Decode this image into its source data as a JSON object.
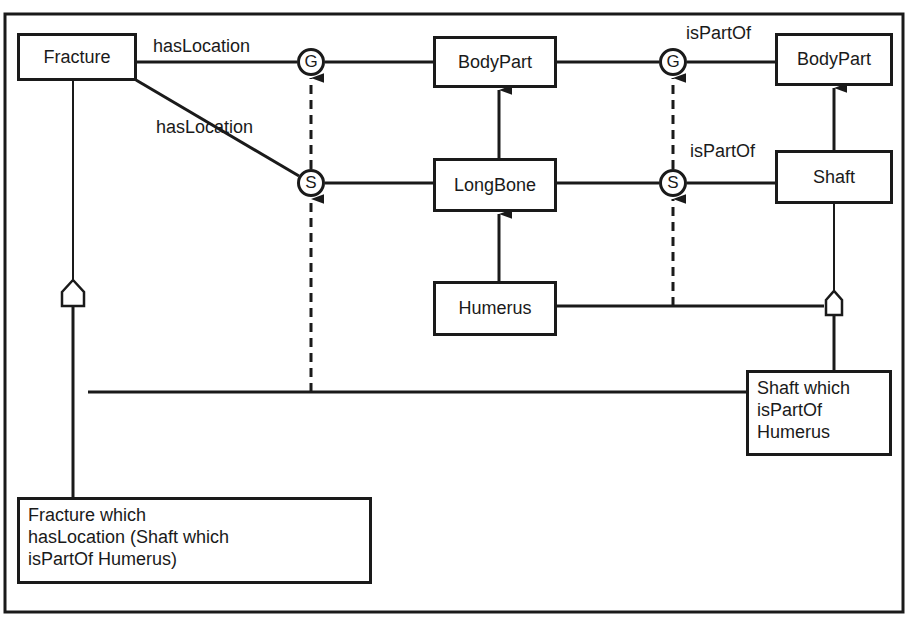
{
  "diagram": {
    "nodes": {
      "fracture": "Fracture",
      "bodypart_mid": "BodyPart",
      "bodypart_right": "BodyPart",
      "longbone": "LongBone",
      "shaft": "Shaft",
      "humerus": "Humerus",
      "shaft_which": [
        "Shaft which",
        "isPartOf",
        "Humerus"
      ],
      "fracture_which": [
        "Fracture which",
        "hasLocation (Shaft which",
        "isPartOf Humerus)"
      ]
    },
    "edge_labels": {
      "top_left": "hasLocation",
      "diag_left": "hasLocation",
      "top_right": "isPartOf",
      "mid_right": "isPartOf"
    },
    "circles": {
      "g_left": "G",
      "g_right": "G",
      "s_left": "S",
      "s_right": "S"
    },
    "colors": {
      "stroke": "#1a1a1a",
      "background": "#ffffff"
    }
  }
}
